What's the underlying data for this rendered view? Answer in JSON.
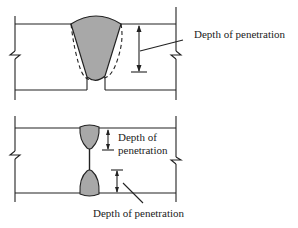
{
  "diagram": {
    "top_panel": {
      "name": "groove-weld-single-side",
      "label": "Depth of penetration"
    },
    "bottom_panel": {
      "name": "double-sided-partial-penetration-weld",
      "upper_label_line1": "Depth of",
      "upper_label_line2": "penetration",
      "lower_label": "Depth of penetration"
    },
    "colors": {
      "line": "#222222",
      "weld_fill": "#a8a8a8",
      "background": "#ffffff"
    }
  }
}
